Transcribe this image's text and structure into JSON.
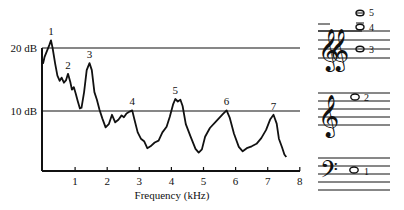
{
  "chart_data": {
    "type": "line",
    "title": "",
    "xlabel": "Frequency (kHz)",
    "ylabel": "",
    "xlim": [
      0,
      8
    ],
    "x_ticks": [
      "1",
      "2",
      "3",
      "4",
      "5",
      "6",
      "7",
      "8"
    ],
    "y_reference_lines": [
      {
        "label": "20 dB",
        "value": 20
      },
      {
        "label": "10 dB",
        "value": 10
      }
    ],
    "grid": false,
    "legend": null,
    "series": [
      {
        "name": "spectrum",
        "points": [
          [
            0.0,
            17.5
          ],
          [
            0.05,
            18.6
          ],
          [
            0.12,
            19.5
          ],
          [
            0.2,
            20.5
          ],
          [
            0.25,
            21.2
          ],
          [
            0.3,
            20.0
          ],
          [
            0.38,
            17.5
          ],
          [
            0.45,
            15.6
          ],
          [
            0.52,
            14.8
          ],
          [
            0.58,
            15.3
          ],
          [
            0.65,
            14.5
          ],
          [
            0.72,
            14.9
          ],
          [
            0.78,
            15.9
          ],
          [
            0.85,
            14.6
          ],
          [
            0.9,
            13.4
          ],
          [
            0.96,
            13.8
          ],
          [
            1.02,
            12.8
          ],
          [
            1.08,
            11.6
          ],
          [
            1.15,
            10.4
          ],
          [
            1.2,
            10.5
          ],
          [
            1.28,
            13.0
          ],
          [
            1.36,
            16.5
          ],
          [
            1.45,
            17.6
          ],
          [
            1.52,
            16.5
          ],
          [
            1.6,
            13.0
          ],
          [
            1.68,
            11.8
          ],
          [
            1.76,
            10.2
          ],
          [
            1.85,
            8.8
          ],
          [
            1.95,
            7.4
          ],
          [
            2.05,
            7.9
          ],
          [
            2.15,
            9.4
          ],
          [
            2.25,
            8.2
          ],
          [
            2.35,
            8.6
          ],
          [
            2.45,
            9.3
          ],
          [
            2.52,
            9.0
          ],
          [
            2.6,
            9.6
          ],
          [
            2.7,
            9.9
          ],
          [
            2.78,
            10.1
          ],
          [
            2.85,
            8.6
          ],
          [
            2.95,
            6.6
          ],
          [
            3.05,
            5.6
          ],
          [
            3.15,
            5.2
          ],
          [
            3.25,
            4.1
          ],
          [
            3.35,
            4.4
          ],
          [
            3.48,
            5.0
          ],
          [
            3.6,
            5.3
          ],
          [
            3.72,
            6.6
          ],
          [
            3.85,
            7.5
          ],
          [
            3.95,
            9.1
          ],
          [
            4.05,
            11.0
          ],
          [
            4.12,
            11.9
          ],
          [
            4.2,
            11.5
          ],
          [
            4.28,
            11.8
          ],
          [
            4.35,
            10.8
          ],
          [
            4.45,
            7.9
          ],
          [
            4.6,
            5.9
          ],
          [
            4.75,
            4.0
          ],
          [
            4.85,
            3.4
          ],
          [
            4.95,
            3.9
          ],
          [
            5.05,
            5.9
          ],
          [
            5.2,
            7.3
          ],
          [
            5.4,
            8.4
          ],
          [
            5.6,
            9.5
          ],
          [
            5.72,
            10.1
          ],
          [
            5.82,
            8.9
          ],
          [
            5.95,
            6.4
          ],
          [
            6.1,
            4.3
          ],
          [
            6.22,
            3.6
          ],
          [
            6.35,
            4.1
          ],
          [
            6.5,
            4.4
          ],
          [
            6.65,
            4.8
          ],
          [
            6.8,
            5.7
          ],
          [
            6.95,
            7.0
          ],
          [
            7.08,
            8.7
          ],
          [
            7.18,
            9.4
          ],
          [
            7.28,
            8.0
          ],
          [
            7.35,
            5.6
          ],
          [
            7.45,
            4.2
          ],
          [
            7.52,
            3.1
          ],
          [
            7.58,
            2.7
          ]
        ]
      }
    ],
    "peak_labels": [
      {
        "label": "1",
        "x": 0.25,
        "y": 21.2
      },
      {
        "label": "2",
        "x": 0.78,
        "y": 15.9
      },
      {
        "label": "3",
        "x": 1.45,
        "y": 17.6
      },
      {
        "label": "4",
        "x": 2.78,
        "y": 10.1
      },
      {
        "label": "5",
        "x": 4.12,
        "y": 11.9
      },
      {
        "label": "6",
        "x": 5.72,
        "y": 10.1
      },
      {
        "label": "7",
        "x": 7.18,
        "y": 9.4
      }
    ]
  },
  "notation": {
    "staff_top": {
      "clef": "treble-octave-stack",
      "notes": [
        {
          "label": "5"
        },
        {
          "label": "4"
        },
        {
          "label": "3"
        }
      ]
    },
    "staff_middle": {
      "clef": "treble",
      "notes": [
        {
          "label": "2"
        }
      ]
    },
    "staff_bottom": {
      "clef": "bass",
      "notes": [
        {
          "label": "1"
        }
      ]
    }
  }
}
